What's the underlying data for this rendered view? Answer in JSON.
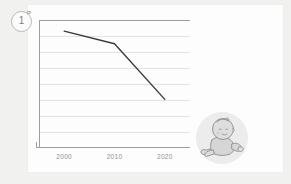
{
  "slide": {
    "marker_label": "1",
    "background_color": "#f1f1f0",
    "card_color": "#fdfdfd"
  },
  "chart_data": {
    "type": "line",
    "title": "",
    "subtitle": "",
    "xlabel": "",
    "ylabel": "g",
    "categories": [
      "2000",
      "2010",
      "2020"
    ],
    "x": [
      2000,
      2010,
      2020
    ],
    "series": [
      {
        "name": "trend",
        "values": [
          7.3,
          6.5,
          3.0
        ],
        "color": "#3a3a3a"
      }
    ],
    "xlim": [
      1995,
      2025
    ],
    "ylim": [
      0,
      8
    ],
    "yticks": [
      0,
      1,
      2,
      3,
      4,
      5,
      6,
      7,
      8
    ],
    "grid": true,
    "grid_color": "#e4e4e4",
    "axis_color": "#9e9e9e",
    "legend": false,
    "legend_position": "none",
    "tick_label_color": "#909090",
    "annotations": []
  },
  "axis": {
    "y_unit_label": "g",
    "xticks": [
      {
        "label": "2000",
        "x_px": 21
      },
      {
        "label": "2010",
        "x_px": 76
      },
      {
        "label": "2020",
        "x_px": 130
      }
    ]
  },
  "illustration": {
    "name": "crawling-baby",
    "circle_color": "#ebebeb",
    "line_color": "#8f8f8f",
    "skin_color": "#d9d9d9"
  }
}
